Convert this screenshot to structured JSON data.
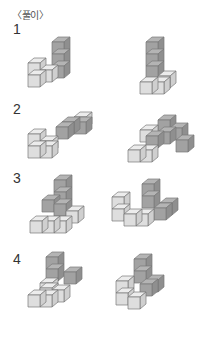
{
  "header": {
    "title": "〈풀이〉"
  },
  "colors": {
    "light_top": "#ececec",
    "light_front": "#dedede",
    "light_side": "#cfcfcf",
    "dark_top": "#b4b4b4",
    "dark_front": "#a2a2a2",
    "dark_side": "#8f8f8f",
    "edge": "#7a7a7a"
  },
  "cube": {
    "size": 12,
    "dx": 6,
    "dy": 5
  },
  "problems": [
    {
      "label": "1",
      "label_top": 28,
      "figures": [
        {
          "name": "figure-1-left",
          "cubes": [
            {
              "x": 52,
              "y": 66,
              "s": "d"
            },
            {
              "x": 52,
              "y": 54,
              "s": "d"
            },
            {
              "x": 52,
              "y": 42,
              "s": "d"
            },
            {
              "x": 40,
              "y": 70,
              "s": "l"
            },
            {
              "x": 28,
              "y": 75,
              "s": "l"
            },
            {
              "x": 28,
              "y": 63,
              "s": "l"
            }
          ]
        },
        {
          "name": "figure-1-right",
          "cubes": [
            {
              "x": 146,
              "y": 66,
              "s": "d"
            },
            {
              "x": 146,
              "y": 54,
              "s": "d"
            },
            {
              "x": 146,
              "y": 42,
              "s": "d"
            },
            {
              "x": 158,
              "y": 76,
              "s": "l"
            },
            {
              "x": 140,
              "y": 82,
              "s": "l"
            },
            {
              "x": 152,
              "y": 82,
              "s": "l"
            }
          ]
        }
      ]
    },
    {
      "label": "2",
      "label_top": 108,
      "figures": [
        {
          "name": "figure-2-left",
          "cubes": [
            {
              "x": 74,
              "y": 117,
              "s": "l"
            },
            {
              "x": 62,
              "y": 122,
              "s": "d"
            },
            {
              "x": 74,
              "y": 122,
              "s": "d"
            },
            {
              "x": 56,
              "y": 127,
              "s": "d"
            },
            {
              "x": 40,
              "y": 141,
              "s": "l"
            },
            {
              "x": 28,
              "y": 146,
              "s": "l"
            },
            {
              "x": 40,
              "y": 146,
              "s": "l"
            },
            {
              "x": 28,
              "y": 134,
              "s": "l"
            }
          ]
        },
        {
          "name": "figure-2-right",
          "cubes": [
            {
              "x": 170,
              "y": 128,
              "s": "d"
            },
            {
              "x": 158,
              "y": 132,
              "s": "d"
            },
            {
              "x": 158,
              "y": 120,
              "s": "d"
            },
            {
              "x": 146,
              "y": 136,
              "s": "d"
            },
            {
              "x": 176,
              "y": 140,
              "s": "d"
            },
            {
              "x": 140,
              "y": 130,
              "s": "l"
            },
            {
              "x": 128,
              "y": 150,
              "s": "l"
            },
            {
              "x": 140,
              "y": 150,
              "s": "l"
            }
          ]
        }
      ]
    },
    {
      "label": "3",
      "label_top": 176,
      "figures": [
        {
          "name": "figure-3-left",
          "cubes": [
            {
              "x": 54,
              "y": 192,
              "s": "d"
            },
            {
              "x": 54,
              "y": 180,
              "s": "d"
            },
            {
              "x": 66,
              "y": 211,
              "s": "l"
            },
            {
              "x": 42,
              "y": 200,
              "s": "d"
            },
            {
              "x": 54,
              "y": 204,
              "s": "d"
            },
            {
              "x": 30,
              "y": 221,
              "s": "l"
            },
            {
              "x": 42,
              "y": 221,
              "s": "l"
            },
            {
              "x": 54,
              "y": 221,
              "s": "l"
            }
          ]
        },
        {
          "name": "figure-3-right",
          "cubes": [
            {
              "x": 142,
              "y": 196,
              "s": "d"
            },
            {
              "x": 142,
              "y": 184,
              "s": "d"
            },
            {
              "x": 160,
              "y": 203,
              "s": "d"
            },
            {
              "x": 154,
              "y": 208,
              "s": "d"
            },
            {
              "x": 112,
              "y": 209,
              "s": "l"
            },
            {
              "x": 112,
              "y": 197,
              "s": "l"
            },
            {
              "x": 124,
              "y": 214,
              "s": "l"
            },
            {
              "x": 136,
              "y": 214,
              "s": "l"
            }
          ]
        }
      ]
    },
    {
      "label": "4",
      "label_top": 257,
      "figures": [
        {
          "name": "figure-4-left",
          "cubes": [
            {
              "x": 46,
              "y": 269,
              "s": "d"
            },
            {
              "x": 46,
              "y": 257,
              "s": "d"
            },
            {
              "x": 64,
              "y": 272,
              "s": "d"
            },
            {
              "x": 40,
              "y": 288,
              "s": "l"
            },
            {
              "x": 28,
              "y": 295,
              "s": "l"
            },
            {
              "x": 40,
              "y": 295,
              "s": "l"
            },
            {
              "x": 52,
              "y": 290,
              "s": "l"
            },
            {
              "x": 40,
              "y": 283,
              "s": "l"
            }
          ]
        },
        {
          "name": "figure-4-right",
          "cubes": [
            {
              "x": 134,
              "y": 271,
              "s": "d"
            },
            {
              "x": 134,
              "y": 259,
              "s": "d"
            },
            {
              "x": 146,
              "y": 280,
              "s": "d"
            },
            {
              "x": 140,
              "y": 284,
              "s": "d"
            },
            {
              "x": 116,
              "y": 293,
              "s": "l"
            },
            {
              "x": 116,
              "y": 281,
              "s": "l"
            },
            {
              "x": 128,
              "y": 297,
              "s": "l"
            }
          ]
        }
      ]
    }
  ]
}
